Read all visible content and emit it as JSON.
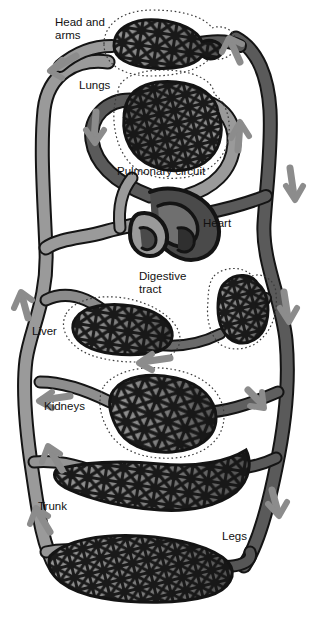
{
  "figure": {
    "background": "#ffffff"
  },
  "colors": {
    "artery_oxygenated": "#9a9a9a",
    "vein_deoxygenated": "#5a5a5a",
    "heart_dark": "#4a4a4a",
    "outline": "#1a1a1a",
    "arrow": "#8c8c8c",
    "organ_boundary": "#333333",
    "text": "#111111",
    "page_background": "#ffffff"
  },
  "labels": {
    "head_and_arms": "Head and\narms",
    "lungs": "Lungs",
    "pulmonary_circuit": "Pulmonary circuit",
    "heart": "Heart",
    "digestive_tract": "Digestive\ntract",
    "liver": "Liver",
    "kidneys": "Kidneys",
    "trunk": "Trunk",
    "legs": "Legs"
  },
  "label_positions": {
    "head_and_arms": {
      "x": 55,
      "y": 16
    },
    "lungs": {
      "x": 79,
      "y": 79
    },
    "pulmonary_circuit": {
      "x": 117,
      "y": 165
    },
    "heart": {
      "x": 203,
      "y": 217
    },
    "digestive_tract": {
      "x": 139,
      "y": 270
    },
    "liver": {
      "x": 32,
      "y": 325
    },
    "kidneys": {
      "x": 44,
      "y": 400
    },
    "trunk": {
      "x": 38,
      "y": 500
    },
    "legs": {
      "x": 222,
      "y": 530
    }
  },
  "capillary_beds": [
    {
      "name": "head-and-arms-capillary-bed",
      "label": "Head and arms"
    },
    {
      "name": "lungs-capillary-bed",
      "label": "Lungs"
    },
    {
      "name": "digestive-tract-capillary-bed",
      "label": "Digestive tract"
    },
    {
      "name": "liver-capillary-bed",
      "label": "Liver"
    },
    {
      "name": "kidneys-capillary-bed",
      "label": "Kidneys"
    },
    {
      "name": "trunk-capillary-bed",
      "label": "Trunk"
    },
    {
      "name": "legs-capillary-bed",
      "label": "Legs"
    }
  ],
  "flow_arrows": [
    {
      "name": "arrow-head-arms-outflow",
      "direction": "left"
    },
    {
      "name": "arrow-vena-cava-upward",
      "direction": "up"
    },
    {
      "name": "arrow-pulmonary-artery-down",
      "direction": "down"
    },
    {
      "name": "arrow-pulmonary-vein-up",
      "direction": "up"
    },
    {
      "name": "arrow-aorta-descending",
      "direction": "down"
    },
    {
      "name": "arrow-liver-inflow",
      "direction": "up-left"
    },
    {
      "name": "arrow-digestive-outflow",
      "direction": "left"
    },
    {
      "name": "arrow-kidneys-outflow",
      "direction": "left"
    },
    {
      "name": "arrow-renal-inflow",
      "direction": "down-right"
    },
    {
      "name": "arrow-trunk-return",
      "direction": "up-left"
    },
    {
      "name": "arrow-legs-return",
      "direction": "up-left"
    },
    {
      "name": "arrow-legs-inflow",
      "direction": "down-right"
    }
  ]
}
